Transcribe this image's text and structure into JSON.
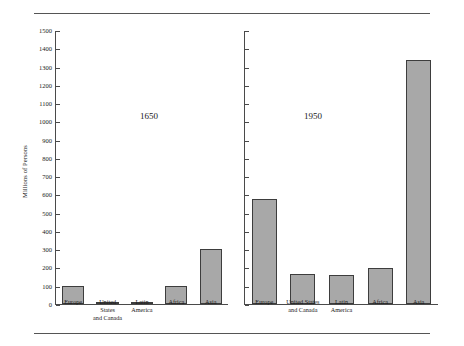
{
  "chart_data": {
    "type": "bar",
    "title": "",
    "subtitle": "",
    "xlabel": "",
    "ylabel": "Millions of Persons",
    "ylim": [
      0,
      1500
    ],
    "ytick_step": 100,
    "yticks": [
      0,
      100,
      200,
      300,
      400,
      500,
      600,
      700,
      800,
      900,
      1000,
      1100,
      1200,
      1300,
      1400,
      1500
    ],
    "ytick_labels": [
      "0",
      "100",
      "200",
      "300",
      "400",
      "500",
      "600",
      "700",
      "800",
      "900",
      "1000",
      "1100",
      "1200",
      "1300",
      "1400",
      "1500"
    ],
    "grid": false,
    "legend": "none",
    "categories": [
      "Europe",
      "United States\nand Canada",
      "Latin\nAmerica",
      "Africa",
      "Asia"
    ],
    "panels": [
      {
        "label": "1650",
        "shows_yaxis_labels": true,
        "values": [
          100,
          5,
          12,
          100,
          300
        ]
      },
      {
        "label": "1950",
        "shows_yaxis_labels": false,
        "values": [
          575,
          166,
          162,
          198,
          1340
        ]
      }
    ],
    "series": [
      {
        "name": "1650",
        "values": [
          100,
          5,
          12,
          100,
          300
        ]
      },
      {
        "name": "1950",
        "values": [
          575,
          166,
          162,
          198,
          1340
        ]
      }
    ],
    "bar_fill_color": "#a8a8a8",
    "bar_edge_color": "#3d3d3d",
    "axis_color": "#4a4a4a",
    "background_color": "#ffffff"
  }
}
